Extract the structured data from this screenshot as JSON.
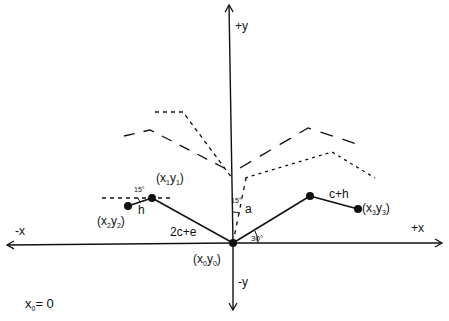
{
  "diagram": {
    "axes": {
      "pos_y": "+y",
      "neg_y": "-y",
      "pos_x": "+x",
      "neg_x": "-x"
    },
    "points": {
      "p0": {
        "name": "x",
        "sub": "0",
        "name2": "y",
        "sub2": "0"
      },
      "p1": {
        "name": "x",
        "sub": "1",
        "name2": "y",
        "sub2": "1"
      },
      "p2": {
        "name": "x",
        "sub": "2",
        "name2": "y",
        "sub2": "2"
      },
      "p3": {
        "name": "x",
        "sub": "3",
        "name2": "y",
        "sub2": "3"
      }
    },
    "segment_labels": {
      "left_arm": "2c+e",
      "right_arm": "c+h",
      "hand_left": "h",
      "angle_a": "a"
    },
    "angles": {
      "vertical_offset": "15°",
      "hand_offset": "15°",
      "right_arm": "30°"
    },
    "note": {
      "var": "x",
      "sub": "0",
      "rest": "= 0"
    },
    "colors": {
      "ink": "#111111",
      "background": "#ffffff"
    }
  }
}
